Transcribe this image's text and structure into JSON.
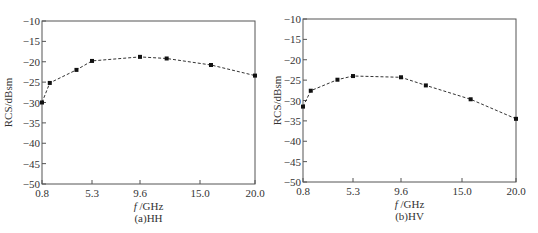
{
  "chart_data": [
    {
      "type": "line",
      "caption": "(a)HH",
      "title": "",
      "xlabel": "f /GHz",
      "ylabel": "RCS/dBsm",
      "x_ticks": [
        "0.8",
        "5.3",
        "9.6",
        "15.0",
        "20.0"
      ],
      "y_ticks": [
        "-10",
        "-15",
        "-20",
        "-25",
        "-30",
        "-35",
        "-40",
        "-45",
        "-50"
      ],
      "ylim": [
        -50,
        -10
      ],
      "xlim": [
        0.8,
        20.0
      ],
      "grid": false,
      "line_style": "dashed",
      "marker": "square",
      "series": [
        {
          "name": "HH",
          "x": [
            0.8,
            1.5,
            3.9,
            5.3,
            9.6,
            12.0,
            16.0,
            20.0
          ],
          "y": [
            -30.0,
            -25.2,
            -22.0,
            -19.8,
            -18.8,
            -19.2,
            -20.8,
            -23.4
          ]
        }
      ]
    },
    {
      "type": "line",
      "caption": "(b)HV",
      "title": "",
      "xlabel": "f /GHz",
      "ylabel": "RCS/dBsm",
      "x_ticks": [
        "0.8",
        "5.3",
        "9.6",
        "15.0",
        "20.0"
      ],
      "y_ticks": [
        "-10",
        "-15",
        "-20",
        "-25",
        "-30",
        "-35",
        "-40",
        "-45",
        "-50"
      ],
      "ylim": [
        -50,
        -10
      ],
      "xlim": [
        0.8,
        20.0
      ],
      "grid": false,
      "line_style": "dashed",
      "marker": "square",
      "series": [
        {
          "name": "HV",
          "x": [
            0.8,
            1.5,
            3.9,
            5.3,
            9.6,
            11.8,
            15.8,
            20.0
          ],
          "y": [
            -31.5,
            -27.6,
            -24.9,
            -24.0,
            -24.3,
            -26.3,
            -29.7,
            -34.5
          ]
        }
      ]
    }
  ],
  "layout": [
    {
      "left": 42,
      "right": 255,
      "top": 21,
      "bottom": 184,
      "tick_px": [
        42,
        92,
        140,
        200,
        255
      ]
    },
    {
      "left": 34,
      "right": 247,
      "top": 19,
      "bottom": 182,
      "tick_px": [
        34,
        84,
        132,
        193,
        247
      ]
    }
  ],
  "colors": {
    "axis": "#555555",
    "line": "#333333",
    "marker": "#111111"
  }
}
